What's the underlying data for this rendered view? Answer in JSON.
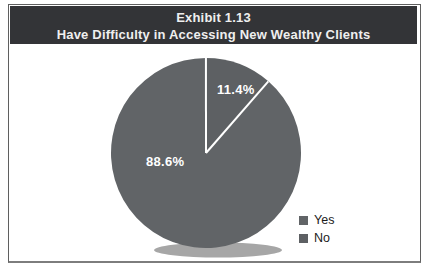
{
  "window": {
    "background": "#ffffff",
    "frame_border_color": "#5f5f5f"
  },
  "header": {
    "line1": "Exhibit 1.13",
    "line2": "Have Difficulty in Accessing New Wealthy Clients",
    "bg_color": "#333437",
    "text_color": "#efefef"
  },
  "chart_data": {
    "type": "pie",
    "title": "Exhibit 1.13",
    "subtitle": "Have Difficulty in Accessing New Wealthy Clients",
    "slices": [
      {
        "label": "Yes",
        "value": 88.6,
        "display": "88.6%",
        "color": "#616467"
      },
      {
        "label": "No",
        "value": 11.4,
        "display": "11.4%",
        "color": "#5d6063"
      }
    ],
    "start_angle_deg": 41,
    "direction": "clockwise",
    "slice_divider_color": "#ffffff",
    "data_label_color": "#ffffff",
    "legend_position": "bottom-right",
    "shadow_color": "#a6a6a6"
  }
}
